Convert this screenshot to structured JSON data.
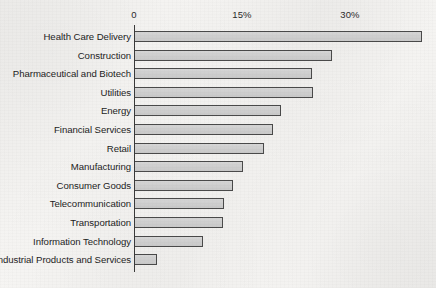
{
  "chart_data": {
    "type": "bar",
    "orientation": "horizontal",
    "title": "",
    "subtitle": "",
    "xlabel": "",
    "ylabel": "",
    "xlim": [
      0,
      40
    ],
    "grid": false,
    "legend": null,
    "axis": {
      "tick_labels": [
        "0",
        "15%",
        "30%"
      ],
      "tick_values": [
        0,
        15,
        30
      ],
      "position": "top"
    },
    "categories": [
      "Health Care Delivery",
      "Construction",
      "Pharmaceutical and Biotech",
      "Utilities",
      "Energy",
      "Financial Services",
      "Retail",
      "Manufacturing",
      "Consumer Goods",
      "Telecommunication",
      "Transportation",
      "Information Technology",
      "Industrial Products and Services"
    ],
    "values": [
      40,
      27.5,
      24.7,
      24.8,
      20.4,
      19.2,
      18,
      15,
      13.7,
      12.4,
      12.3,
      9.5,
      3
    ],
    "bar_fill_color": "#d0d0d0",
    "bar_border_color": "#4a4a4a",
    "background_color": "#f3f2f0"
  }
}
